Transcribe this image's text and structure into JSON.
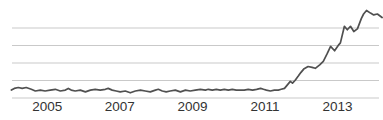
{
  "chart_data": {
    "type": "line",
    "title": "",
    "xlabel": "",
    "ylabel": "",
    "legend": "none",
    "grid": "horizontal",
    "xlim": [
      2004.0,
      2014.25
    ],
    "ylim": [
      0,
      112
    ],
    "grid_values": [
      0,
      20,
      40,
      60,
      80
    ],
    "x_tick_years": [
      2005,
      2007,
      2009,
      2011,
      2013
    ],
    "x_tick_labels": [
      "2005",
      "2007",
      "2009",
      "2011",
      "2013"
    ],
    "colors": {
      "line": "#505050",
      "gridline": "#c9c9c9",
      "tick_label": "#333333",
      "background": "#ffffff"
    },
    "series": [
      {
        "name": "trend",
        "points": [
          [
            2004.01,
            9
          ],
          [
            2004.09,
            11
          ],
          [
            2004.2,
            12
          ],
          [
            2004.31,
            11
          ],
          [
            2004.42,
            12
          ],
          [
            2004.56,
            10
          ],
          [
            2004.67,
            8
          ],
          [
            2004.81,
            9
          ],
          [
            2004.94,
            8
          ],
          [
            2005.08,
            9
          ],
          [
            2005.22,
            10
          ],
          [
            2005.36,
            8
          ],
          [
            2005.5,
            9
          ],
          [
            2005.58,
            11
          ],
          [
            2005.66,
            9
          ],
          [
            2005.77,
            8
          ],
          [
            2005.91,
            9
          ],
          [
            2006.05,
            7
          ],
          [
            2006.19,
            9
          ],
          [
            2006.32,
            10
          ],
          [
            2006.46,
            9
          ],
          [
            2006.6,
            10
          ],
          [
            2006.68,
            11
          ],
          [
            2006.79,
            9
          ],
          [
            2006.9,
            8
          ],
          [
            2007.01,
            7
          ],
          [
            2007.15,
            8
          ],
          [
            2007.29,
            6
          ],
          [
            2007.43,
            8
          ],
          [
            2007.57,
            9
          ],
          [
            2007.7,
            8
          ],
          [
            2007.84,
            7
          ],
          [
            2007.98,
            9
          ],
          [
            2008.06,
            10
          ],
          [
            2008.17,
            8
          ],
          [
            2008.28,
            7
          ],
          [
            2008.39,
            8
          ],
          [
            2008.53,
            9
          ],
          [
            2008.67,
            7
          ],
          [
            2008.81,
            9
          ],
          [
            2008.94,
            8
          ],
          [
            2009.08,
            9
          ],
          [
            2009.22,
            10
          ],
          [
            2009.36,
            9
          ],
          [
            2009.44,
            10
          ],
          [
            2009.55,
            9
          ],
          [
            2009.66,
            10
          ],
          [
            2009.77,
            9
          ],
          [
            2009.88,
            10
          ],
          [
            2009.99,
            9
          ],
          [
            2010.1,
            10
          ],
          [
            2010.21,
            9
          ],
          [
            2010.32,
            9
          ],
          [
            2010.43,
            9
          ],
          [
            2010.54,
            10
          ],
          [
            2010.66,
            9
          ],
          [
            2010.77,
            10
          ],
          [
            2010.88,
            11
          ],
          [
            2010.96,
            10
          ],
          [
            2011.04,
            9
          ],
          [
            2011.15,
            8
          ],
          [
            2011.26,
            9
          ],
          [
            2011.37,
            9
          ],
          [
            2011.45,
            10
          ],
          [
            2011.54,
            11
          ],
          [
            2011.62,
            15
          ],
          [
            2011.7,
            19
          ],
          [
            2011.76,
            17
          ],
          [
            2011.83,
            20
          ],
          [
            2011.92,
            25
          ],
          [
            2011.99,
            29
          ],
          [
            2012.07,
            33
          ],
          [
            2012.19,
            36
          ],
          [
            2012.3,
            35
          ],
          [
            2012.39,
            34
          ],
          [
            2012.51,
            38
          ],
          [
            2012.61,
            42
          ],
          [
            2012.72,
            51
          ],
          [
            2012.81,
            59
          ],
          [
            2012.92,
            54
          ],
          [
            2013.04,
            61
          ],
          [
            2013.08,
            63
          ],
          [
            2013.19,
            82
          ],
          [
            2013.27,
            78
          ],
          [
            2013.36,
            82
          ],
          [
            2013.45,
            76
          ],
          [
            2013.55,
            79
          ],
          [
            2013.66,
            91
          ],
          [
            2013.72,
            96
          ],
          [
            2013.8,
            100
          ],
          [
            2013.91,
            97
          ],
          [
            2014.0,
            95
          ],
          [
            2014.1,
            96
          ],
          [
            2014.23,
            92
          ]
        ]
      }
    ]
  }
}
